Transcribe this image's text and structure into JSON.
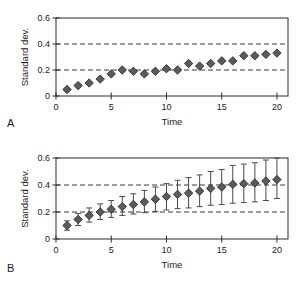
{
  "figure": {
    "panel_a_letter": "A",
    "panel_b_letter": "B"
  },
  "chart_data": [
    {
      "type": "scatter",
      "panel": "A",
      "title": "",
      "xlabel": "Time",
      "ylabel": "Standard dev.",
      "xlim": [
        0,
        21
      ],
      "ylim": [
        0,
        0.6
      ],
      "xticks": [
        0,
        5,
        10,
        15,
        20
      ],
      "xticklabels": [
        "0",
        "5",
        "10",
        "15",
        "20"
      ],
      "yticks": [
        0,
        0.2,
        0.4,
        0.6
      ],
      "yticklabels": [
        "0",
        "0.2",
        "0.4",
        "0.6"
      ],
      "grid": "horizontal-dashed",
      "gridlines": [
        0.2,
        0.4
      ],
      "legend": "none",
      "marker": "diamond",
      "marker_color": "#5b5b5b",
      "marker_edge_color": "#2e2e2e",
      "x": [
        1,
        2,
        3,
        4,
        5,
        6,
        7,
        8,
        9,
        10,
        11,
        12,
        13,
        14,
        15,
        16,
        17,
        18,
        19,
        20
      ],
      "values": [
        0.05,
        0.08,
        0.1,
        0.13,
        0.17,
        0.2,
        0.19,
        0.17,
        0.19,
        0.21,
        0.2,
        0.25,
        0.23,
        0.25,
        0.27,
        0.27,
        0.31,
        0.31,
        0.32,
        0.33
      ]
    },
    {
      "type": "scatter",
      "panel": "B",
      "title": "",
      "xlabel": "Time",
      "ylabel": "Standard dev.",
      "xlim": [
        0,
        21
      ],
      "ylim": [
        0,
        0.6
      ],
      "xticks": [
        0,
        5,
        10,
        15,
        20
      ],
      "xticklabels": [
        "0",
        "5",
        "10",
        "15",
        "20"
      ],
      "yticks": [
        0,
        0.2,
        0.4,
        0.6
      ],
      "yticklabels": [
        "0",
        "0.2",
        "0.4",
        "0.6"
      ],
      "grid": "horizontal-dashed",
      "gridlines": [
        0.2,
        0.4
      ],
      "legend": "none",
      "marker": "diamond",
      "marker_color": "#5b5b5b",
      "marker_edge_color": "#2e2e2e",
      "errorbars": true,
      "x": [
        1,
        2,
        3,
        4,
        5,
        6,
        7,
        8,
        9,
        10,
        11,
        12,
        13,
        14,
        15,
        16,
        17,
        18,
        19,
        20
      ],
      "values": [
        0.1,
        0.145,
        0.175,
        0.2,
        0.22,
        0.24,
        0.255,
        0.275,
        0.295,
        0.315,
        0.33,
        0.34,
        0.355,
        0.375,
        0.385,
        0.405,
        0.41,
        0.415,
        0.43,
        0.44
      ],
      "err_low": [
        0.065,
        0.1,
        0.125,
        0.145,
        0.16,
        0.175,
        0.185,
        0.195,
        0.205,
        0.215,
        0.225,
        0.23,
        0.24,
        0.25,
        0.255,
        0.265,
        0.27,
        0.275,
        0.285,
        0.3
      ],
      "err_high": [
        0.135,
        0.19,
        0.23,
        0.26,
        0.285,
        0.315,
        0.335,
        0.36,
        0.385,
        0.41,
        0.435,
        0.455,
        0.475,
        0.5,
        0.515,
        0.545,
        0.555,
        0.565,
        0.585,
        0.6
      ]
    }
  ]
}
